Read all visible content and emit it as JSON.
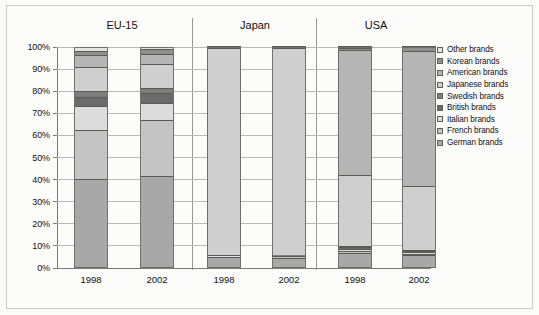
{
  "chart_data": {
    "type": "bar",
    "subtype": "stacked-percentage-column",
    "title": "",
    "xlabel": "",
    "ylabel": "",
    "ylim": [
      0,
      100
    ],
    "ytick_labels": [
      "0%",
      "10%",
      "20%",
      "30%",
      "40%",
      "50%",
      "60%",
      "70%",
      "80%",
      "90%",
      "100%"
    ],
    "ytick_values": [
      0,
      10,
      20,
      30,
      40,
      50,
      60,
      70,
      80,
      90,
      100
    ],
    "grid": true,
    "legend_position": "right",
    "group_labels": [
      "EU-15",
      "Japan",
      "USA"
    ],
    "categories": [
      "1998",
      "2002",
      "1998",
      "2002",
      "1998",
      "2002"
    ],
    "column_keys": [
      "EU-15 1998",
      "EU-15 2002",
      "Japan 1998",
      "Japan 2002",
      "USA 1998",
      "USA 2002"
    ],
    "stack_order_bottom_to_top": [
      "German brands",
      "French brands",
      "Italian brands",
      "British brands",
      "Swedish brands",
      "Japanese brands",
      "American brands",
      "Korean brands",
      "Other brands"
    ],
    "series": [
      {
        "name": "German brands",
        "color": "#a8a8a8",
        "values": [
          40.5,
          41.7,
          4.8,
          4.7,
          7.0,
          5.8
        ]
      },
      {
        "name": "French brands",
        "color": "#c4c4c4",
        "values": [
          22.0,
          25.5,
          0.4,
          0.4,
          0.5,
          0.5
        ]
      },
      {
        "name": "Italian brands",
        "color": "#dcdcdc",
        "values": [
          11.0,
          7.5,
          0.3,
          0.3,
          1.2,
          0.8
        ]
      },
      {
        "name": "British brands",
        "color": "#6b6b6b",
        "values": [
          4.0,
          4.5,
          0.2,
          0.2,
          0.8,
          0.6
        ]
      },
      {
        "name": "Swedish brands",
        "color": "#7d7d7d",
        "values": [
          2.5,
          2.3,
          0.2,
          0.2,
          0.5,
          0.4
        ]
      },
      {
        "name": "Japanese brands",
        "color": "#cfcfcf",
        "values": [
          11.0,
          11.0,
          93.6,
          93.8,
          32.0,
          29.0
        ]
      },
      {
        "name": "American brands",
        "color": "#b5b5b5",
        "values": [
          5.5,
          4.5,
          0.3,
          0.3,
          56.5,
          61.3
        ]
      },
      {
        "name": "Korean brands",
        "color": "#8f8f8f",
        "values": [
          1.8,
          2.0,
          0.2,
          0.1,
          1.2,
          1.4
        ]
      },
      {
        "name": "Other brands",
        "color": "#e4e4e4",
        "values": [
          1.7,
          1.0,
          0.0,
          0.0,
          0.3,
          0.2
        ]
      }
    ]
  },
  "legend": {
    "items": [
      {
        "label": "Other brands",
        "color": "#e4e4e4"
      },
      {
        "label": "Korean brands",
        "color": "#8f8f8f"
      },
      {
        "label": "American brands",
        "color": "#b5b5b5"
      },
      {
        "label": "Japanese brands",
        "color": "#cfcfcf"
      },
      {
        "label": "Swedish brands",
        "color": "#7d7d7d"
      },
      {
        "label": "British brands",
        "color": "#6b6b6b"
      },
      {
        "label": "Italian brands",
        "color": "#dcdcdc"
      },
      {
        "label": "French brands",
        "color": "#c4c4c4"
      },
      {
        "label": "German brands",
        "color": "#a8a8a8"
      }
    ]
  },
  "groups": [
    {
      "label": "EU-15"
    },
    {
      "label": "Japan"
    },
    {
      "label": "USA"
    }
  ],
  "colors": {
    "axis": "#7c7c78",
    "grid": "#b9b9b4",
    "separator": "#9a9a95",
    "text": "#111111",
    "background": "#fcfcfb",
    "bar_outline": "#6f6f6b"
  }
}
